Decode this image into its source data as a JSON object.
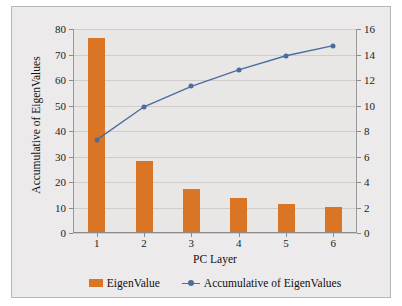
{
  "chart_data": {
    "type": "bar",
    "title": "",
    "subtitle": "",
    "xlabel": "PC Layer",
    "ylabel": "Accumulative of EigenValues",
    "y2label": "EigenValue",
    "categories": [
      "1",
      "2",
      "3",
      "4",
      "5",
      "6"
    ],
    "ylim": [
      0,
      80
    ],
    "y2lim": [
      0,
      16
    ],
    "yticks": [
      0,
      10,
      20,
      30,
      40,
      50,
      60,
      70,
      80
    ],
    "y2ticks": [
      0,
      2,
      4,
      6,
      8,
      10,
      12,
      14,
      16
    ],
    "ytick_labels": [
      "0",
      "10",
      "20",
      "30",
      "40",
      "50",
      "60",
      "70",
      "80"
    ],
    "y2tick_labels": [
      "0",
      "2",
      "4",
      "6",
      "8",
      "10",
      "12",
      "14",
      "16"
    ],
    "grid": true,
    "legend_position": "bottom",
    "series": [
      {
        "name": "EigenValue",
        "type": "bar",
        "axis": "right",
        "color": "#db7526",
        "values": [
          15.2,
          5.6,
          3.35,
          2.65,
          2.2,
          2.0
        ]
      },
      {
        "name": "Accumulative of EigenValues",
        "type": "line",
        "axis": "left",
        "color": "#4a6d9e",
        "values": [
          36.5,
          49.5,
          57.5,
          64.0,
          69.5,
          73.5
        ]
      }
    ],
    "legend": [
      "EigenValue",
      "Accumulative of EigenValues"
    ]
  },
  "colors": {
    "bar": "#db7526",
    "line": "#4a6d9e",
    "plot_background": "#e9e7e6",
    "figure_background": "#eceaea",
    "gridline": "#cfcdcb",
    "axis": "#8d8b89",
    "text": "#1b1b1b"
  }
}
